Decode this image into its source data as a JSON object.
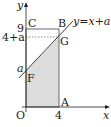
{
  "diagram": {
    "type": "coordinate-geometry",
    "axes": {
      "x_label": "x",
      "y_label": "y",
      "origin_label": "O"
    },
    "ticks": {
      "x": [
        "4"
      ],
      "y": [
        "9",
        "4+a",
        "a"
      ]
    },
    "points": {
      "O": "O",
      "A": "A",
      "B": "B",
      "C": "C",
      "F": "F",
      "G": "G"
    },
    "line_label": "y=x+a",
    "shaded_region": "OAGF",
    "colors": {
      "stroke": "#222222",
      "shade": "#dddddd",
      "dashed": "#555555"
    }
  }
}
